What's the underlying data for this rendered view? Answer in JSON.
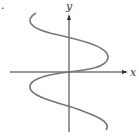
{
  "figure": {
    "marker": ".",
    "axes": {
      "x_label": "x",
      "y_label": "y",
      "color": "#333333"
    },
    "curve": {
      "description": "sinusoidal curve x = sin(y) passing through origin",
      "color": "#777777"
    }
  }
}
